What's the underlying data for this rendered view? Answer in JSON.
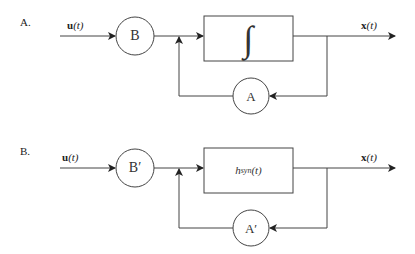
{
  "diagrams": [
    {
      "label": "A.",
      "input": {
        "var": "u",
        "arg": "(t)"
      },
      "input_gain": "B",
      "block": "∫",
      "feedback_gain": "A",
      "output": {
        "var": "x",
        "arg": "(t)"
      }
    },
    {
      "label": "B.",
      "input": {
        "var": "u",
        "arg": "(t)"
      },
      "input_gain": "B′",
      "block": {
        "base": "h",
        "sub": "syn",
        "arg": "(t)"
      },
      "feedback_gain": "A′",
      "output": {
        "var": "x",
        "arg": "(t)"
      }
    }
  ]
}
